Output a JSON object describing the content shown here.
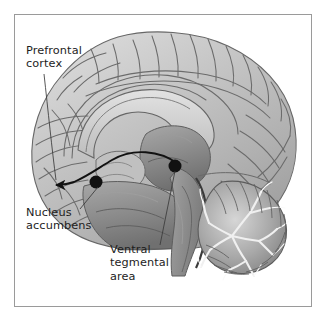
{
  "figure": {
    "kind": "anatomical-illustration",
    "style": "grayscale medical illustration with thin gray border frame",
    "background_color": "#ffffff",
    "frame_color": "#9a9a9a",
    "text_color": "#1d1d1d"
  },
  "labels": {
    "prefrontal_cortex": "Prefrontal\ncortex",
    "nucleus_accumbens": "Nucleus\naccumbens",
    "ventral_tegmental_area": "Ventral\ntegmental\narea"
  },
  "annotations": {
    "markers": [
      {
        "name": "nucleus-accumbens-marker",
        "x": 96,
        "y": 182,
        "radius": 6.5,
        "color": "#111111"
      },
      {
        "name": "ventral-tegmental-area-marker",
        "x": 175,
        "y": 166,
        "radius": 6.5,
        "color": "#111111"
      }
    ],
    "pathway": {
      "name": "mesolimbic-dopamine-pathway",
      "description": "Curved arrow from ventral tegmental area through nucleus accumbens to prefrontal cortex",
      "color": "#111111",
      "arrowhead_at": "prefrontal-cortex"
    },
    "leader_lines": [
      {
        "from": "prefrontal-cortex-label",
        "to_x": 55,
        "to_y": 180
      },
      {
        "from": "nucleus-accumbens-label",
        "to_x": 96,
        "to_y": 185
      },
      {
        "from": "ventral-tegmental-area-label",
        "to_x": 175,
        "to_y": 170
      }
    ]
  },
  "structures": [
    "cerebral cortex",
    "corpus callosum",
    "thalamus",
    "cerebellum",
    "brainstem",
    "occipital lobe",
    "frontal lobe"
  ],
  "palette": {
    "cortex_light": "#cfcfcf",
    "cortex_mid": "#b4b4b4",
    "cortex_dark": "#8e8e8e",
    "deep_gray": "#6f6f6f",
    "outline": "#5a5a5a"
  }
}
